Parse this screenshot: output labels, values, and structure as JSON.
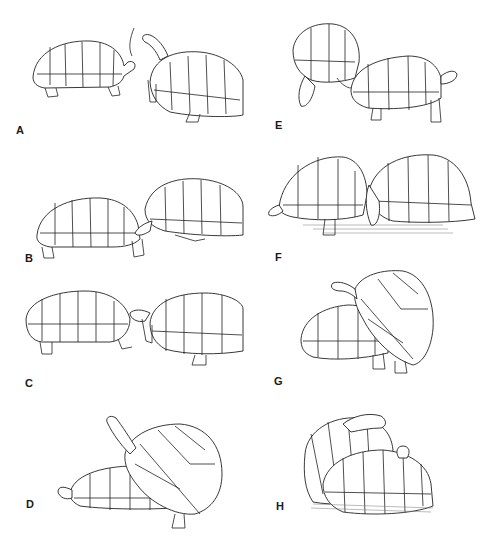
{
  "figure": {
    "type": "multi-panel line illustration",
    "background": "#ffffff",
    "ink_color": "#222222",
    "panels": [
      {
        "id": "A",
        "label": "A",
        "description": "two tortoises approaching; female (♀) left, male (♂) right with raised head"
      },
      {
        "id": "B",
        "label": "B",
        "description": "male head extended toward female's head"
      },
      {
        "id": "C",
        "label": "C",
        "description": "face to face, male with mouth open"
      },
      {
        "id": "D",
        "label": "D",
        "description": "male mounting female from behind, head raised"
      },
      {
        "id": "E",
        "label": "E",
        "description": "male nudging female's rear"
      },
      {
        "id": "F",
        "label": "F",
        "description": "male biting at female's hind leg, ground shading"
      },
      {
        "id": "G",
        "label": "G",
        "description": "male mounting female, head raised"
      },
      {
        "id": "H",
        "label": "H",
        "description": "mounted pair viewed obliquely from front"
      }
    ],
    "symbols": {
      "female": "♀",
      "male": "♂"
    }
  }
}
